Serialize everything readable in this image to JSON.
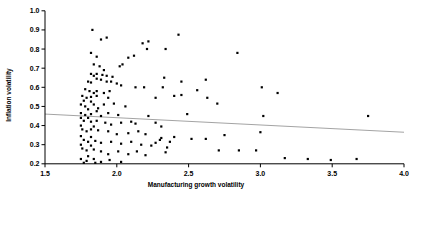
{
  "chart_data": {
    "type": "scatter",
    "title": "",
    "xlabel": "Manufacturing growth volatility",
    "ylabel": "Inflation volatility",
    "xlim": [
      1.5,
      4.0
    ],
    "ylim": [
      0.2,
      1.0
    ],
    "x_ticks": [
      "1.5",
      "2.0",
      "2.5",
      "3.0",
      "3.5",
      "4.0"
    ],
    "y_ticks": [
      "0.2",
      "0.3",
      "0.4",
      "0.5",
      "0.6",
      "0.7",
      "0.8",
      "0.9",
      "1.0"
    ],
    "grid": false,
    "legend_position": "none",
    "point_color": "#000000",
    "axis_color": "#000000",
    "trend_line": {
      "x1": 1.5,
      "y1": 0.46,
      "x2": 4.0,
      "y2": 0.365,
      "color": "#999999"
    },
    "points": [
      [
        1.83,
        0.9
      ],
      [
        1.89,
        0.85
      ],
      [
        1.93,
        0.86
      ],
      [
        2.18,
        0.83
      ],
      [
        2.22,
        0.84
      ],
      [
        1.82,
        0.78
      ],
      [
        1.86,
        0.76
      ],
      [
        2.08,
        0.755
      ],
      [
        2.12,
        0.765
      ],
      [
        2.21,
        0.8
      ],
      [
        1.84,
        0.72
      ],
      [
        1.88,
        0.71
      ],
      [
        1.91,
        0.69
      ],
      [
        2.02,
        0.71
      ],
      [
        2.04,
        0.72
      ],
      [
        1.82,
        0.67
      ],
      [
        1.84,
        0.66
      ],
      [
        1.86,
        0.67
      ],
      [
        1.9,
        0.665
      ],
      [
        1.93,
        0.66
      ],
      [
        1.97,
        0.655
      ],
      [
        1.86,
        0.645
      ],
      [
        1.89,
        0.64
      ],
      [
        1.8,
        0.63
      ],
      [
        1.82,
        0.625
      ],
      [
        1.93,
        0.63
      ],
      [
        1.96,
        0.63
      ],
      [
        2.0,
        0.62
      ],
      [
        2.03,
        0.61
      ],
      [
        2.13,
        0.6
      ],
      [
        2.19,
        0.6
      ],
      [
        1.78,
        0.59
      ],
      [
        1.81,
        0.58
      ],
      [
        1.84,
        0.57
      ],
      [
        1.86,
        0.58
      ],
      [
        1.91,
        0.57
      ],
      [
        1.95,
        0.58
      ],
      [
        2.43,
        0.875
      ],
      [
        2.34,
        0.8
      ],
      [
        2.84,
        0.78
      ],
      [
        2.33,
        0.65
      ],
      [
        2.45,
        0.63
      ],
      [
        2.62,
        0.64
      ],
      [
        2.32,
        0.6
      ],
      [
        2.56,
        0.585
      ],
      [
        3.01,
        0.6
      ],
      [
        3.12,
        0.57
      ],
      [
        2.27,
        0.545
      ],
      [
        2.4,
        0.555
      ],
      [
        2.45,
        0.56
      ],
      [
        2.63,
        0.545
      ],
      [
        2.7,
        0.515
      ],
      [
        2.49,
        0.46
      ],
      [
        2.22,
        0.45
      ],
      [
        2.27,
        0.415
      ],
      [
        2.31,
        0.395
      ],
      [
        2.75,
        0.35
      ],
      [
        3.0,
        0.365
      ],
      [
        3.02,
        0.45
      ],
      [
        2.24,
        0.295
      ],
      [
        2.27,
        0.31
      ],
      [
        2.3,
        0.325
      ],
      [
        2.31,
        0.335
      ],
      [
        2.4,
        0.34
      ],
      [
        2.35,
        0.285
      ],
      [
        2.34,
        0.26
      ],
      [
        2.37,
        0.315
      ],
      [
        2.52,
        0.33
      ],
      [
        2.62,
        0.33
      ],
      [
        2.71,
        0.27
      ],
      [
        2.85,
        0.27
      ],
      [
        2.97,
        0.27
      ],
      [
        3.17,
        0.23
      ],
      [
        3.33,
        0.225
      ],
      [
        3.49,
        0.22
      ],
      [
        3.67,
        0.225
      ],
      [
        3.75,
        0.45
      ],
      [
        1.76,
        0.555
      ],
      [
        1.79,
        0.545
      ],
      [
        1.82,
        0.55
      ],
      [
        1.86,
        0.555
      ],
      [
        1.94,
        0.545
      ],
      [
        1.77,
        0.53
      ],
      [
        1.82,
        0.525
      ],
      [
        1.75,
        0.51
      ],
      [
        1.78,
        0.5
      ],
      [
        1.84,
        0.51
      ],
      [
        1.87,
        0.49
      ],
      [
        1.91,
        0.51
      ],
      [
        1.98,
        0.515
      ],
      [
        2.06,
        0.5
      ],
      [
        1.8,
        0.485
      ],
      [
        1.86,
        0.475
      ],
      [
        1.75,
        0.465
      ],
      [
        1.78,
        0.455
      ],
      [
        1.82,
        0.46
      ],
      [
        1.89,
        0.45
      ],
      [
        1.94,
        0.465
      ],
      [
        2.01,
        0.455
      ],
      [
        1.75,
        0.44
      ],
      [
        1.8,
        0.44
      ],
      [
        1.77,
        0.425
      ],
      [
        1.82,
        0.42
      ],
      [
        1.86,
        0.425
      ],
      [
        1.92,
        0.415
      ],
      [
        1.96,
        0.405
      ],
      [
        2.03,
        0.415
      ],
      [
        2.1,
        0.42
      ],
      [
        2.13,
        0.41
      ],
      [
        1.75,
        0.4
      ],
      [
        1.84,
        0.395
      ],
      [
        1.76,
        0.38
      ],
      [
        1.79,
        0.37
      ],
      [
        1.82,
        0.38
      ],
      [
        1.87,
        0.375
      ],
      [
        1.94,
        0.37
      ],
      [
        2.0,
        0.355
      ],
      [
        2.08,
        0.36
      ],
      [
        2.15,
        0.37
      ],
      [
        2.2,
        0.355
      ],
      [
        1.75,
        0.345
      ],
      [
        1.82,
        0.34
      ],
      [
        1.77,
        0.325
      ],
      [
        1.8,
        0.315
      ],
      [
        1.85,
        0.32
      ],
      [
        1.89,
        0.31
      ],
      [
        1.96,
        0.315
      ],
      [
        2.03,
        0.305
      ],
      [
        2.1,
        0.315
      ],
      [
        2.17,
        0.3
      ],
      [
        1.75,
        0.3
      ],
      [
        1.82,
        0.295
      ],
      [
        1.76,
        0.28
      ],
      [
        1.79,
        0.27
      ],
      [
        1.84,
        0.275
      ],
      [
        1.89,
        0.265
      ],
      [
        1.94,
        0.25
      ],
      [
        2.01,
        0.265
      ],
      [
        2.08,
        0.25
      ],
      [
        2.14,
        0.265
      ],
      [
        2.2,
        0.245
      ],
      [
        1.8,
        0.24
      ],
      [
        1.75,
        0.225
      ],
      [
        1.79,
        0.215
      ],
      [
        1.84,
        0.225
      ],
      [
        1.89,
        0.21
      ],
      [
        1.95,
        0.22
      ],
      [
        2.03,
        0.21
      ],
      [
        1.77,
        0.205
      ],
      [
        1.85,
        0.205
      ]
    ]
  }
}
